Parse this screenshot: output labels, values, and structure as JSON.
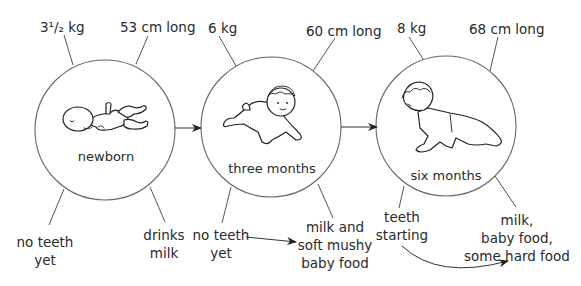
{
  "diagram": {
    "type": "baby growth stages",
    "stages": [
      {
        "name": "newborn",
        "weight": "3¹/₂ kg",
        "length": "53 cm long",
        "teeth": [
          "no teeth",
          "yet"
        ],
        "food": [
          "drinks",
          "milk"
        ]
      },
      {
        "name": "three months",
        "weight": "6 kg",
        "length": "60 cm long",
        "teeth": [
          "no teeth",
          "yet"
        ],
        "food": [
          "milk and",
          "soft mushy",
          "baby food"
        ]
      },
      {
        "name": "six months",
        "weight": "8 kg",
        "length": "68 cm long",
        "teeth": [
          "teeth",
          "starting"
        ],
        "food": [
          "milk,",
          "baby food,",
          "some hard food"
        ]
      }
    ],
    "colors": {
      "line": "#555555",
      "text": "#2a2a2a",
      "background": "#ffffff"
    }
  }
}
